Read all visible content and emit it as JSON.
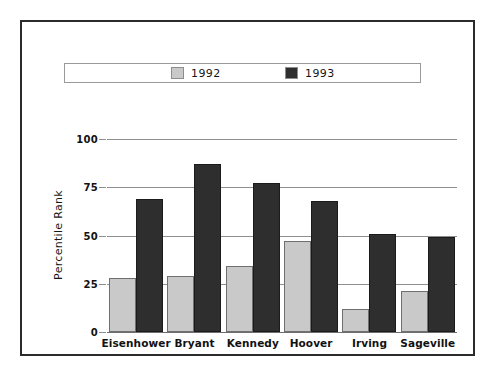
{
  "chart_data": {
    "type": "bar",
    "title": "",
    "subtitle": "",
    "xlabel": "",
    "ylabel": "Percentile Rank",
    "categories": [
      "Eisenhower",
      "Bryant",
      "Kennedy",
      "Hoover",
      "Irving",
      "Sageville"
    ],
    "series": [
      {
        "name": "1992",
        "color": "#c9c9c9",
        "values": [
          28,
          29,
          34,
          47,
          12,
          21
        ]
      },
      {
        "name": "1993",
        "color": "#2e2e2e",
        "values": [
          69,
          87,
          77,
          68,
          51,
          49
        ]
      }
    ],
    "ylim": [
      0,
      100
    ],
    "yticks": [
      0,
      25,
      50,
      75,
      100
    ],
    "ytick_labels": [
      "0",
      "25",
      "50",
      "75",
      "100"
    ],
    "grid": true,
    "legend_position": "top"
  },
  "legend": {
    "entries": [
      {
        "label": "1992"
      },
      {
        "label": "1993"
      }
    ]
  },
  "frame": {
    "border_color": "#2b2b2b",
    "background": "#ffffff"
  }
}
